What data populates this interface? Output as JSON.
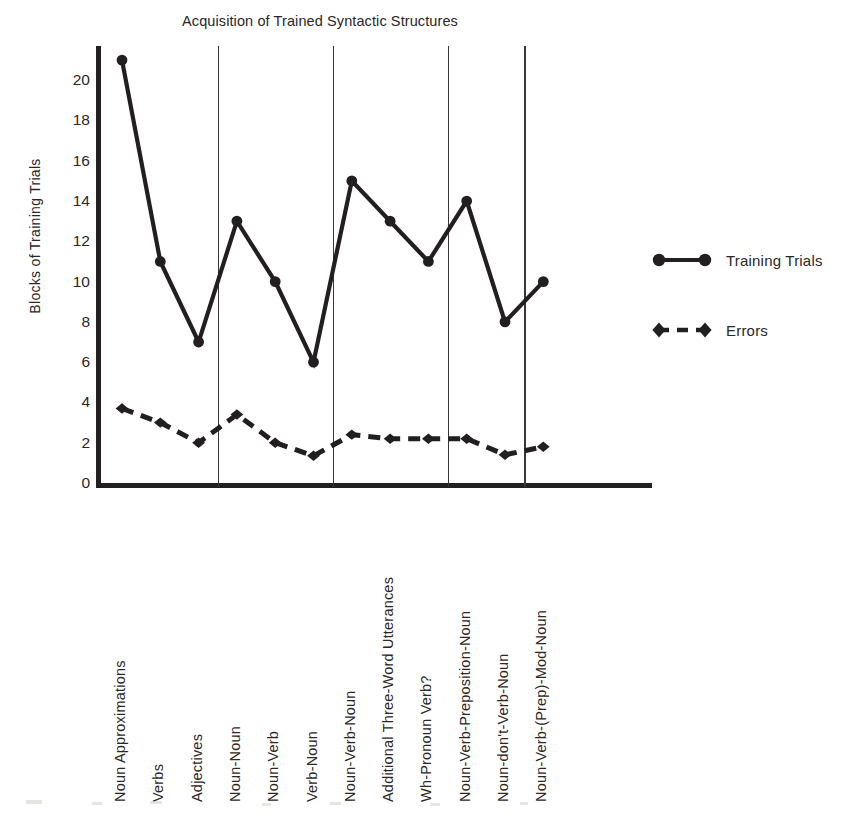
{
  "chart_data": {
    "type": "line",
    "title": "Acquisition of Trained Syntactic Structures",
    "xlabel": "",
    "ylabel": "Blocks of Training Trials",
    "ylim": [
      0,
      21.5
    ],
    "yticks": [
      0,
      2,
      4,
      6,
      8,
      10,
      12,
      14,
      16,
      18,
      20
    ],
    "ytick_labels": [
      "0",
      "2",
      "4",
      "6",
      "8",
      "10",
      "12",
      "14",
      "16",
      "18",
      "20"
    ],
    "grid": false,
    "legend_position": "right",
    "categories": [
      "Noun Approximations",
      "Verbs",
      "Adjectives",
      "Noun-Noun",
      "Noun-Verb",
      "Verb-Noun",
      "Noun-Verb-Noun",
      "Additional Three-Word Utterances",
      "Wh-Pronoun Verb?",
      "Noun-Verb-Preposition-Noun",
      "Noun-don't-Verb-Noun",
      "Noun-Verb-(Prep)-Mod-Noun"
    ],
    "series": [
      {
        "name": "Training Trials",
        "marker": "circle",
        "linestyle": "solid",
        "color": "#231f20",
        "values": [
          21,
          11,
          7,
          13,
          10,
          6,
          15,
          13,
          11,
          14,
          8,
          10
        ]
      },
      {
        "name": "Errors",
        "marker": "diamond",
        "linestyle": "dashed",
        "color": "#231f20",
        "values": [
          3.7,
          3.0,
          2.0,
          3.4,
          2.0,
          1.35,
          2.4,
          2.2,
          2.2,
          2.2,
          1.4,
          1.8
        ]
      }
    ],
    "group_separators_after_category_index": [
      2,
      5,
      8,
      10
    ],
    "annotations": []
  },
  "legend": {
    "entries": [
      {
        "label": "Training Trials",
        "swatch": "solid-line-circle-marker"
      },
      {
        "label": "Errors",
        "swatch": "dashed-line-diamond-marker"
      }
    ]
  },
  "colors": {
    "ink": "#231f20",
    "separator": "#3a3634",
    "background": "#ffffff"
  }
}
